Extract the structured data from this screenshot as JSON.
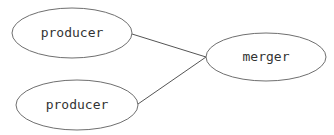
{
  "diagram": {
    "type": "graph",
    "nodes": [
      {
        "id": "producer1",
        "label": "producer",
        "shape": "ellipse",
        "cx": 72,
        "cy": 33,
        "rx": 60,
        "ry": 25
      },
      {
        "id": "producer2",
        "label": "producer",
        "shape": "ellipse",
        "cx": 77,
        "cy": 105,
        "rx": 61,
        "ry": 25
      },
      {
        "id": "merger",
        "label": "merger",
        "shape": "ellipse",
        "cx": 266,
        "cy": 57,
        "rx": 60,
        "ry": 24
      }
    ],
    "edges": [
      {
        "from": "producer1",
        "to": "merger"
      },
      {
        "from": "producer2",
        "to": "merger"
      }
    ],
    "colors": {
      "stroke": "#6f6f6f",
      "text": "#333333",
      "background": "#ffffff"
    }
  }
}
